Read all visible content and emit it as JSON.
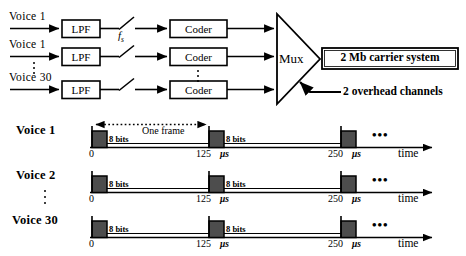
{
  "figure": {
    "accent_color": "#000000",
    "pulse_fill": "#4d4d4d",
    "background": "#ffffff"
  },
  "block_diagram": {
    "inputs": [
      {
        "label": "Voice  1"
      },
      {
        "label": "Voice  1"
      },
      {
        "label": "Voice 30"
      }
    ],
    "vertical_ellipsis_inputs": "⋮",
    "filter_label": "LPF",
    "filters": [
      {
        "label": "LPF"
      },
      {
        "label": "LPF"
      },
      {
        "label": "LPF"
      }
    ],
    "sampler": {
      "label": "f",
      "subscript": "s",
      "icon": "switch-icon"
    },
    "coders": [
      {
        "label": "Coder"
      },
      {
        "label": "Coder"
      },
      {
        "label": "Coder"
      }
    ],
    "coder_ellipsis": "⋮",
    "mux": {
      "label": "Mux"
    },
    "output_box": {
      "label": "2 Mb carrier system"
    },
    "overhead": {
      "label": "2 overhead channels"
    }
  },
  "timing_diagram": {
    "rows": [
      {
        "name": "Voice 1",
        "label": "Voice 1",
        "slot_label": "8 bits",
        "frame_label": "One frame",
        "show_frame_marker": true,
        "ticks": [
          {
            "value": "0",
            "unit": ""
          },
          {
            "value": "125",
            "unit": "μs"
          },
          {
            "value": "250",
            "unit": "μs"
          }
        ],
        "repeat_dots": "•••",
        "axis_label": "time"
      },
      {
        "name": "Voice 2",
        "label": "Voice 2",
        "slot_label": "8 bits",
        "frame_label": "",
        "show_frame_marker": false,
        "ticks": [
          {
            "value": "0",
            "unit": ""
          },
          {
            "value": "125",
            "unit": "μs"
          },
          {
            "value": "250",
            "unit": "μs"
          }
        ],
        "repeat_dots": "•••",
        "axis_label": "time"
      },
      {
        "name": "Voice 30",
        "label": "Voice 30",
        "slot_label": "8 bits",
        "frame_label": "",
        "show_frame_marker": false,
        "ticks": [
          {
            "value": "0",
            "unit": ""
          },
          {
            "value": "125",
            "unit": "μs"
          },
          {
            "value": "250",
            "unit": "μs"
          }
        ],
        "repeat_dots": "•••",
        "axis_label": "time"
      }
    ],
    "vertical_ellipsis": "⋮"
  }
}
